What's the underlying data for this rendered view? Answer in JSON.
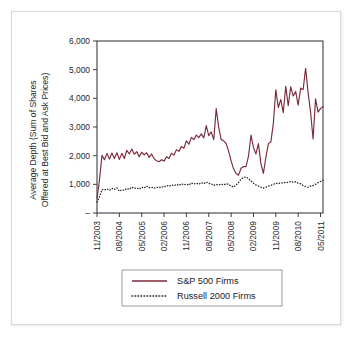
{
  "figure": {
    "background_color": "#ffffff",
    "border_color": "#d6d9de"
  },
  "chart_data": {
    "type": "line",
    "title": "",
    "xlabel": "",
    "ylabel": "Average Depth (Sum of Shares Offered at Best Bid and Ask Prices)",
    "ylabel_line1": "Average Depth (Sum of Shares",
    "ylabel_line2": "Offered at Best Bid and Ask Prices)",
    "ylim": [
      0,
      6000
    ],
    "ytick_labels": [
      "6,000",
      "5,000",
      "4,000",
      "3,000",
      "2,000",
      "1,000",
      "–"
    ],
    "ytick_values": [
      6000,
      5000,
      4000,
      3000,
      2000,
      1000,
      0
    ],
    "grid": false,
    "legend_position": "below",
    "xtick_labels": [
      "11/2003",
      "08/2004",
      "05/2005",
      "02/2006",
      "11/2006",
      "08/2007",
      "05/2008",
      "02/2009",
      "11/2009",
      "08/2010",
      "05/2011"
    ],
    "xtick_indices": [
      0,
      9,
      18,
      27,
      36,
      45,
      54,
      63,
      72,
      81,
      90
    ],
    "x_count": 92,
    "series": [
      {
        "name": "S&P 500 Firms",
        "style": "solid",
        "color": "#7a2b3b",
        "values": [
          520,
          1150,
          2010,
          1860,
          2080,
          1880,
          2090,
          1900,
          2100,
          1870,
          2080,
          1900,
          2190,
          2060,
          2230,
          2050,
          2140,
          1960,
          2120,
          2030,
          2100,
          1940,
          2060,
          1890,
          1820,
          1790,
          1860,
          1810,
          1960,
          1900,
          2080,
          2020,
          2210,
          2150,
          2320,
          2260,
          2520,
          2400,
          2640,
          2560,
          2720,
          2630,
          2760,
          2620,
          3050,
          2700,
          2830,
          2560,
          3640,
          2990,
          2560,
          2520,
          2420,
          2160,
          1820,
          1540,
          1380,
          1320,
          1560,
          1620,
          1620,
          1980,
          2720,
          2280,
          2060,
          2420,
          1720,
          1380,
          1940,
          2420,
          2480,
          3120,
          4300,
          3680,
          3960,
          3500,
          4420,
          3740,
          4400,
          4080,
          4240,
          3760,
          4360,
          4300,
          5050,
          4200,
          3520,
          2580,
          3980,
          3520,
          3640,
          3720
        ]
      },
      {
        "name": "Russell 2000 Firms",
        "style": "dotted",
        "color": "#22252a",
        "values": [
          380,
          560,
          820,
          800,
          840,
          790,
          860,
          820,
          880,
          760,
          810,
          790,
          860,
          820,
          900,
          860,
          880,
          830,
          900,
          870,
          940,
          880,
          900,
          860,
          900,
          880,
          920,
          900,
          960,
          930,
          980,
          950,
          1000,
          960,
          1020,
          980,
          1010,
          970,
          1050,
          1010,
          1040,
          1000,
          1060,
          1020,
          1080,
          1030,
          1020,
          960,
          1000,
          970,
          1010,
          980,
          1020,
          1000,
          940,
          900,
          980,
          1060,
          1180,
          1240,
          1260,
          1200,
          1120,
          1040,
          980,
          940,
          900,
          870,
          900,
          940,
          960,
          1000,
          1040,
          1020,
          1060,
          1040,
          1080,
          1060,
          1100,
          1070,
          1090,
          1040,
          1020,
          960,
          920,
          900,
          940,
          960,
          1000,
          1060,
          1100,
          1140
        ]
      }
    ],
    "legend_entries": [
      {
        "label": "S&P 500 Firms",
        "style": "solid",
        "color": "#7a2b3b"
      },
      {
        "label": "Russell 2000 Firms",
        "style": "dotted",
        "color": "#22252a"
      }
    ]
  }
}
